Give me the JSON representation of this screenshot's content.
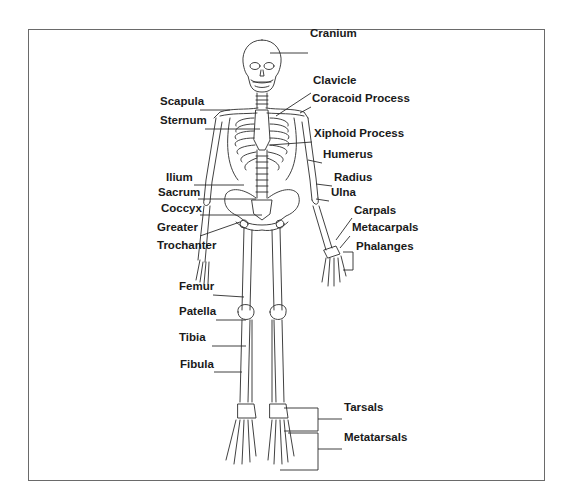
{
  "diagram": {
    "labels": [
      {
        "id": "cranium",
        "text": "Cranium",
        "x": 310,
        "y": 33
      },
      {
        "id": "clavicle",
        "text": "Clavicle",
        "x": 313,
        "y": 80
      },
      {
        "id": "scapula",
        "text": "Scapula",
        "x": 160,
        "y": 101
      },
      {
        "id": "coracoid-process",
        "text": "Coracoid Process",
        "x": 312,
        "y": 98
      },
      {
        "id": "sternum",
        "text": "Sternum",
        "x": 160,
        "y": 120
      },
      {
        "id": "xiphoid-process",
        "text": "Xiphoid Process",
        "x": 314,
        "y": 133
      },
      {
        "id": "humerus",
        "text": "Humerus",
        "x": 323,
        "y": 154
      },
      {
        "id": "ilium",
        "text": "Ilium",
        "x": 166,
        "y": 177
      },
      {
        "id": "radius",
        "text": "Radius",
        "x": 334,
        "y": 177
      },
      {
        "id": "sacrum",
        "text": "Sacrum",
        "x": 158,
        "y": 192
      },
      {
        "id": "ulna",
        "text": "Ulna",
        "x": 331,
        "y": 192
      },
      {
        "id": "coccyx",
        "text": "Coccyx",
        "x": 161,
        "y": 208
      },
      {
        "id": "carpals",
        "text": "Carpals",
        "x": 354,
        "y": 210
      },
      {
        "id": "greater-trochanter-1",
        "text": "Greater",
        "x": 157,
        "y": 227
      },
      {
        "id": "metacarpals",
        "text": "Metacarpals",
        "x": 352,
        "y": 227
      },
      {
        "id": "greater-trochanter-2",
        "text": "Trochanter",
        "x": 157,
        "y": 245
      },
      {
        "id": "phalanges",
        "text": "Phalanges",
        "x": 356,
        "y": 246
      },
      {
        "id": "femur",
        "text": "Femur",
        "x": 179,
        "y": 286
      },
      {
        "id": "patella",
        "text": "Patella",
        "x": 179,
        "y": 311
      },
      {
        "id": "tibia",
        "text": "Tibia",
        "x": 179,
        "y": 337
      },
      {
        "id": "fibula",
        "text": "Fibula",
        "x": 180,
        "y": 364
      },
      {
        "id": "tarsals",
        "text": "Tarsals",
        "x": 344,
        "y": 407
      },
      {
        "id": "metatarsals",
        "text": "Metatarsals",
        "x": 344,
        "y": 437
      }
    ],
    "colors": {
      "line": "#2b2b2b",
      "frame": "#6a6a6a",
      "text": "#1a1a1a"
    }
  }
}
